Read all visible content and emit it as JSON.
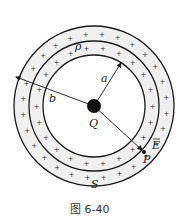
{
  "figure": {
    "caption": "图 6-40",
    "labels": {
      "inner_radius": "a",
      "outer_radius": "b",
      "density": "ρ",
      "charge": "Q",
      "field": "E",
      "point": "P",
      "surface": "S"
    },
    "geometry": {
      "center": [
        94,
        106
      ],
      "inner_radius_px": 51,
      "gauss_surface_radius_px": 65,
      "outer_radius_px": 80,
      "charge_dot_radius_px": 7
    },
    "colors": {
      "shell_fill": "#f0f0f0",
      "stroke": "#1a1a1a"
    }
  }
}
